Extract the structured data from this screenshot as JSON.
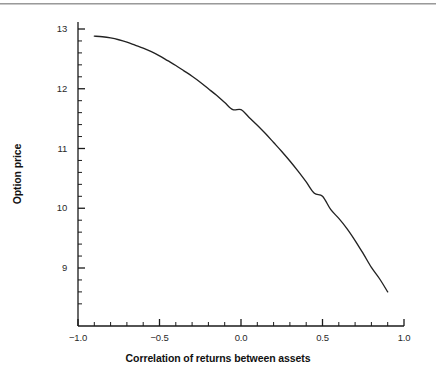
{
  "figure": {
    "background_color": "#ffffff",
    "line_color": "#222222",
    "axis_color": "#1a1a1a",
    "rule_color": "#9a9a9a"
  },
  "chart_data": {
    "type": "line",
    "title": "",
    "xlabel": "Correlation of returns between assets",
    "ylabel": "Option price",
    "xlim": [
      -1.0,
      1.0
    ],
    "ylim": [
      8.4,
      13.2
    ],
    "grid": false,
    "legend": null,
    "x_ticks": [
      -1.0,
      -0.5,
      0.0,
      0.5,
      1.0
    ],
    "x_tick_labels": [
      "-1.0",
      "-0.5",
      "0.0",
      "0.5",
      "1.0"
    ],
    "x_minor_tick_interval": 0.1,
    "y_ticks": [
      9,
      10,
      11,
      12,
      13
    ],
    "y_tick_labels": [
      "9",
      "10",
      "11",
      "12",
      "13"
    ],
    "y_minor_tick_interval": 0.2,
    "series": [
      {
        "name": "Option price vs correlation",
        "x": [
          -0.9,
          -0.85,
          -0.8,
          -0.75,
          -0.7,
          -0.65,
          -0.6,
          -0.55,
          -0.5,
          -0.45,
          -0.4,
          -0.35,
          -0.3,
          -0.25,
          -0.2,
          -0.15,
          -0.1,
          -0.05,
          0.0,
          0.05,
          0.1,
          0.15,
          0.2,
          0.25,
          0.3,
          0.35,
          0.4,
          0.45,
          0.5,
          0.55,
          0.6,
          0.65,
          0.7,
          0.75,
          0.8,
          0.85,
          0.9
        ],
        "y": [
          12.88,
          12.87,
          12.85,
          12.82,
          12.78,
          12.73,
          12.68,
          12.62,
          12.55,
          12.47,
          12.39,
          12.3,
          12.21,
          12.11,
          12.0,
          11.89,
          11.77,
          11.65,
          11.65,
          11.52,
          11.39,
          11.25,
          11.1,
          10.95,
          10.79,
          10.62,
          10.44,
          10.25,
          10.2,
          9.98,
          9.83,
          9.66,
          9.46,
          9.24,
          9.01,
          8.82,
          8.6
        ]
      }
    ]
  },
  "axes": {
    "x_labels": [
      "-1.0",
      "-0.5",
      "0.0",
      "0.5",
      "1.0"
    ],
    "y_labels": [
      "13",
      "12",
      "11",
      "10",
      "9"
    ],
    "x_title": "Correlation of returns between assets",
    "y_title": "Option price"
  }
}
